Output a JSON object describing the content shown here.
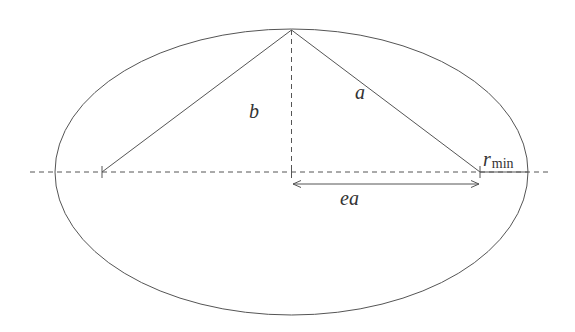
{
  "diagram": {
    "stroke_color": "#555555",
    "text_color": "#333333",
    "ellipse": {
      "cx": 291.5,
      "cy": 172,
      "rx": 236.5,
      "ry": 143
    },
    "major_axis": {
      "x1": 30,
      "x2": 548,
      "y": 172,
      "style": "dashed"
    },
    "minor_semi_axis": {
      "x": 291.5,
      "y1": 30,
      "y2": 172,
      "style": "dashed"
    },
    "foci": [
      {
        "x": 102,
        "y": 172
      },
      {
        "x": 480,
        "y": 172
      }
    ],
    "top_vertex": {
      "x": 291.5,
      "y": 30
    },
    "labels": {
      "b": "b",
      "a": "a",
      "ea": "ea",
      "r_min_main": "r",
      "r_min_sub": "min"
    },
    "ea_arrow": {
      "x1": 292,
      "x2": 480,
      "y": 184
    },
    "r_min_segment": {
      "x1": 480,
      "x2": 528,
      "y": 172
    }
  }
}
